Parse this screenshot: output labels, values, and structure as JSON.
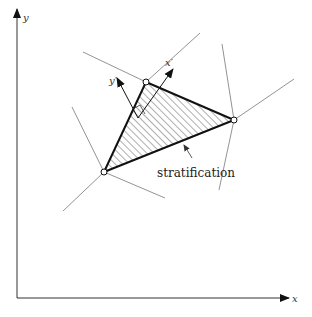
{
  "diagram": {
    "type": "geometric-schematic",
    "axes": {
      "x_label": "x",
      "y_label": "y"
    },
    "local_axes": {
      "x_prime_label": "x′",
      "y_prime_label": "y′"
    },
    "triangle": {
      "vertices": [
        {
          "name": "A",
          "x": 104,
          "y": 172
        },
        {
          "name": "B",
          "x": 146,
          "y": 82
        },
        {
          "name": "C",
          "x": 234,
          "y": 120
        }
      ],
      "fill": "hatched"
    },
    "annotation": {
      "text": "stratification"
    },
    "colors": {
      "stroke": "#111111",
      "thin_line": "#777777",
      "background": "#ffffff"
    }
  }
}
